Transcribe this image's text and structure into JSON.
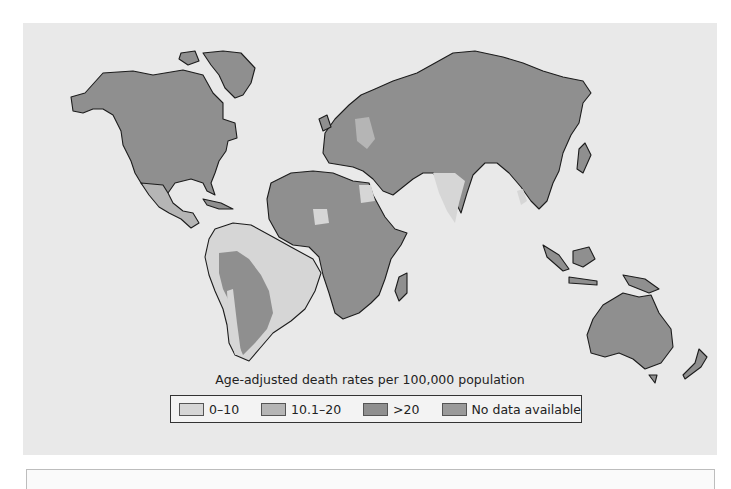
{
  "map": {
    "legend_title": "Age-adjusted death rates per 100,000 population",
    "legend": [
      {
        "label": "0–10",
        "color": "#d6d6d6"
      },
      {
        "label": "10.1–20",
        "color": "#b5b5b5"
      },
      {
        "label": ">20",
        "color": "#8f8f8f"
      },
      {
        "label": "No data available",
        "color": "#9a9a9a"
      }
    ],
    "colors": {
      "ocean": "#e9e9e9",
      "low": "#d6d6d6",
      "mid": "#b5b5b5",
      "high": "#8f8f8f",
      "nodata": "#9a9a9a"
    }
  }
}
